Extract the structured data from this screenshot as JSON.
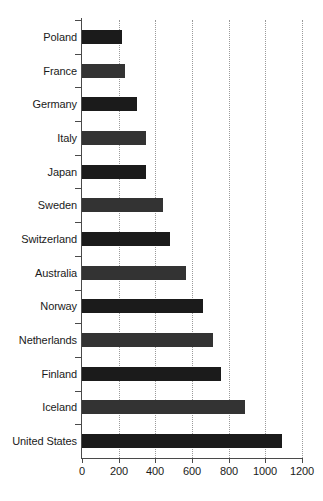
{
  "chart_data": {
    "type": "bar",
    "orientation": "horizontal",
    "title": "",
    "subtitle": "",
    "xlabel": "",
    "ylabel": "",
    "xlim": [
      0,
      1200
    ],
    "xticks": [
      0,
      200,
      400,
      600,
      800,
      1000,
      1200
    ],
    "xticklabels": [
      "0",
      "200",
      "400",
      "600",
      "800",
      "1000",
      "1200"
    ],
    "grid": "vertical-dotted",
    "legend": "none",
    "categories": [
      "Poland",
      "France",
      "Germany",
      "Italy",
      "Japan",
      "Sweden",
      "Switzerland",
      "Australia",
      "Norway",
      "Netherlands",
      "Finland",
      "Iceland",
      "United States"
    ],
    "values": [
      218,
      234,
      300,
      349,
      349,
      442,
      480,
      567,
      660,
      715,
      758,
      889,
      1091
    ],
    "bar_colors": [
      "#1b1b1b",
      "#333333",
      "#1b1b1b",
      "#333333",
      "#1b1b1b",
      "#333333",
      "#1b1b1b",
      "#333333",
      "#1b1b1b",
      "#333333",
      "#1b1b1b",
      "#333333",
      "#1b1b1b"
    ],
    "axis_color": "#4a4a4a",
    "gridline_color": "#9a9a9a",
    "background_color": "#ffffff"
  }
}
